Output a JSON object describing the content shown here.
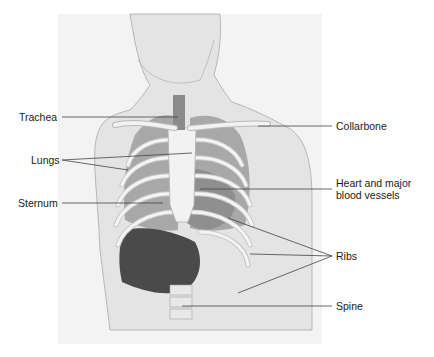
{
  "diagram": {
    "labels": {
      "trachea": "Trachea",
      "lungs": "Lungs",
      "sternum": "Sternum",
      "collarbone": "Collarbone",
      "heart_line1": "Heart and major",
      "heart_line2": "blood vessels",
      "ribs": "Ribs",
      "spine": "Spine"
    },
    "colors": {
      "skin": "#e6e6e6",
      "outline": "#9a9a9a",
      "bone": "#f2f2f2",
      "organ": "#9e9e9e",
      "liver": "#4a4a4a",
      "leader": "#444444"
    }
  }
}
